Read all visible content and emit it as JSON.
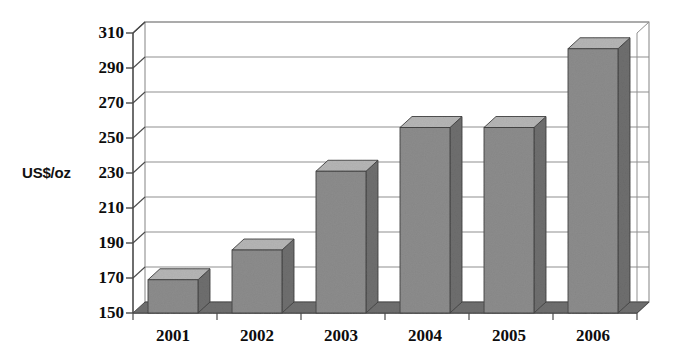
{
  "chart_data": {
    "type": "bar",
    "title": "",
    "subtitle": "",
    "xlabel": "",
    "ylabel": "US$/oz",
    "ylim": [
      150,
      310
    ],
    "ytick_step": 20,
    "categories": [
      "2001",
      "2002",
      "2003",
      "2004",
      "2005",
      "2006"
    ],
    "values": [
      169,
      186,
      231,
      256,
      256,
      301
    ],
    "yticks": [
      "150",
      "170",
      "190",
      "210",
      "230",
      "250",
      "270",
      "290",
      "310"
    ],
    "ytick_values": [
      150,
      170,
      190,
      210,
      230,
      250,
      270,
      290,
      310
    ],
    "grid": true,
    "legend": false,
    "legend_position": "none",
    "series": [
      {
        "name": "Price",
        "values": [
          169,
          186,
          231,
          256,
          256,
          301
        ]
      }
    ],
    "annotations": [],
    "style": "3d-bar-grayscale"
  },
  "colors": {
    "bar_front": "#8c8c8c",
    "bar_top": "#b5b5b5",
    "bar_side": "#6e6e6e",
    "floor": "#6f6f6f",
    "floor_top": "#8a8a8a",
    "grid": "#8f8f8f",
    "axis": "#4a4a4a",
    "text": "#0d0d0d",
    "background": "#ffffff"
  },
  "axis": {
    "y_label": "US$/oz"
  }
}
